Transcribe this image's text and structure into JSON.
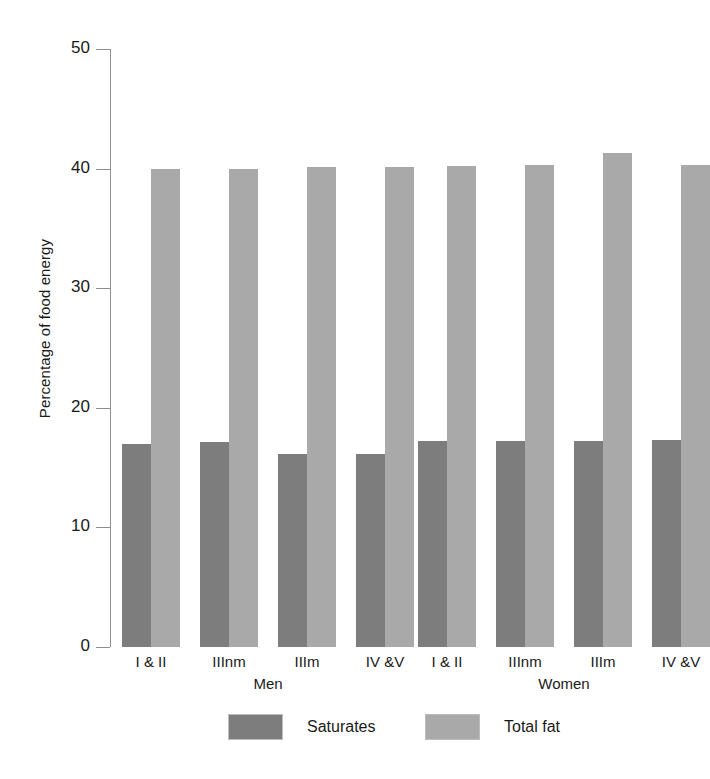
{
  "chart_data": {
    "type": "bar",
    "title": "",
    "xlabel": "",
    "ylabel": "Percentage of food energy",
    "ylim": [
      0,
      50
    ],
    "ytick_labels": [
      "50",
      "40",
      "30",
      "20",
      "10",
      "0"
    ],
    "ytick_values": [
      50,
      40,
      30,
      20,
      10,
      0
    ],
    "grid": false,
    "legend_position": "bottom",
    "groups": [
      "Men",
      "Women"
    ],
    "categories": [
      "I & II",
      "IIInm",
      "IIIm",
      "IV &V"
    ],
    "series": [
      {
        "name": "Saturates",
        "color": "#7d7d7d",
        "values_men": [
          17.0,
          17.1,
          16.1,
          16.1
        ],
        "values_women": [
          17.2,
          17.2,
          17.2,
          17.3
        ]
      },
      {
        "name": "Total fat",
        "color": "#a9a9a9",
        "values_men": [
          40.0,
          40.0,
          40.1,
          40.1
        ],
        "values_women": [
          40.2,
          40.3,
          41.3,
          40.3
        ]
      }
    ]
  },
  "axis": {
    "y_title": "Percentage of food energy"
  },
  "groups": [
    {
      "name": "Men",
      "bars": [
        {
          "category": "I & II",
          "saturates": 17.0,
          "total_fat": 40.0
        },
        {
          "category": "IIInm",
          "saturates": 17.1,
          "total_fat": 40.0
        },
        {
          "category": "IIIm",
          "saturates": 16.1,
          "total_fat": 40.1
        },
        {
          "category": "IV &V",
          "saturates": 16.1,
          "total_fat": 40.1
        }
      ]
    },
    {
      "name": "Women",
      "bars": [
        {
          "category": "I & II",
          "saturates": 17.2,
          "total_fat": 40.2
        },
        {
          "category": "IIInm",
          "saturates": 17.2,
          "total_fat": 40.3
        },
        {
          "category": "IIIm",
          "saturates": 17.2,
          "total_fat": 41.3
        },
        {
          "category": "IV &V",
          "saturates": 17.3,
          "total_fat": 40.3
        }
      ]
    }
  ],
  "legend": {
    "items": [
      {
        "label": "Saturates",
        "color": "#7d7d7d"
      },
      {
        "label": "Total fat",
        "color": "#a9a9a9"
      }
    ]
  }
}
